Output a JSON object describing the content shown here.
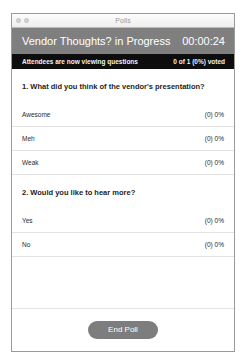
{
  "window": {
    "title": "Polls",
    "controls": [
      "close-button",
      "minimize-button"
    ]
  },
  "poll_header": {
    "title": "Vendor Thoughts? in Progress",
    "timer": "00:00:24",
    "bg_color": "#7f7f7f"
  },
  "status_bar": {
    "message": "Attendees are now viewing questions",
    "voted_summary": "0 of 1 (0%) voted",
    "bg_color": "#0d0d0d"
  },
  "questions": [
    {
      "text": "1. What did you think of the vendor's presentation?",
      "options": [
        {
          "label": "Awesome",
          "result": "(0) 0%"
        },
        {
          "label": "Meh",
          "result": "(0) 0%"
        },
        {
          "label": "Weak",
          "result": "(0) 0%"
        }
      ]
    },
    {
      "text": "2. Would you like to hear more?",
      "options": [
        {
          "label": "Yes",
          "result": "(0) 0%"
        },
        {
          "label": "No",
          "result": "(0) 0%"
        }
      ]
    }
  ],
  "footer": {
    "end_poll_label": "End Poll",
    "button_color": "#7d7d7d"
  }
}
